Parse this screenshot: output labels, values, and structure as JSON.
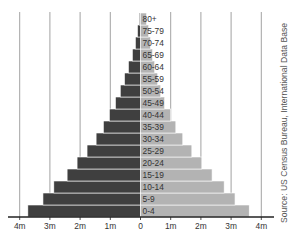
{
  "chart_data": {
    "type": "bar",
    "subtype": "population-pyramid",
    "orientation": "horizontal",
    "title": "",
    "xlabel": "",
    "ylabel": "",
    "categories": [
      "0-4",
      "5-9",
      "10-14",
      "15-19",
      "20-24",
      "25-29",
      "30-34",
      "35-39",
      "40-44",
      "45-49",
      "50-54",
      "55-59",
      "60-64",
      "65-69",
      "70-74",
      "75-79",
      "80+"
    ],
    "series": [
      {
        "name": "Male",
        "side": "left",
        "color": "#3f3f3f",
        "values": [
          3.73,
          3.23,
          2.87,
          2.43,
          2.1,
          1.77,
          1.47,
          1.23,
          1.03,
          0.83,
          0.67,
          0.53,
          0.4,
          0.27,
          0.17,
          0.1,
          0.04
        ]
      },
      {
        "name": "Female",
        "side": "right",
        "color": "#b3b3b3",
        "values": [
          3.6,
          3.13,
          2.77,
          2.37,
          2.03,
          1.7,
          1.4,
          1.17,
          1.0,
          0.8,
          0.67,
          0.57,
          0.47,
          0.4,
          0.33,
          0.27,
          0.2
        ]
      }
    ],
    "x_ticks": [
      "4m",
      "3m",
      "2m",
      "1m",
      "0",
      "1m",
      "2m",
      "3m",
      "4m"
    ],
    "x_tick_values": [
      -4,
      -3,
      -2,
      -1,
      0,
      1,
      2,
      3,
      4
    ],
    "xlim": [
      -4.4,
      4.4
    ],
    "units": "millions",
    "grid": "vertical",
    "legend": "none"
  },
  "source": "Source: US Census Bureau, International Data Base",
  "colors": {
    "male": "#3f3f3f",
    "female": "#b3b3b3",
    "grid": "#8a8a8a",
    "axis": "#222222",
    "bar_border": "#ffffff"
  }
}
